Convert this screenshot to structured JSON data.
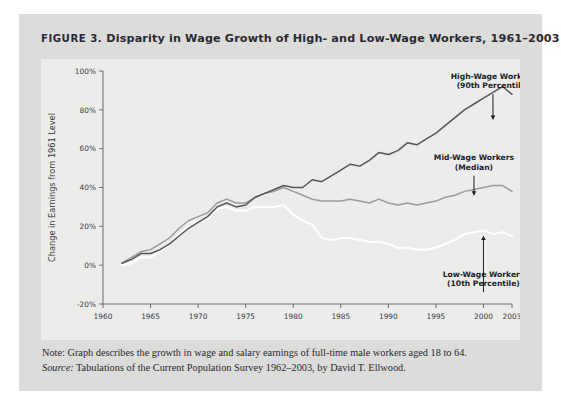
{
  "figure": {
    "label": "FIGURE 3.",
    "title": "Disparity in Wage Growth of High- and Low-Wage Workers, 1961–2003"
  },
  "notes": {
    "note_label": "Note:",
    "note_text": " Graph describes the growth in wage and salary earnings of full-time male workers aged 18 to 64.",
    "source_label": "Source:",
    "source_text": " Tabulations of the Current Population Survey 1962–2003, by David T. Ellwood."
  },
  "colors": {
    "card_background": "#dcdcda",
    "plot_background": "#ececeb",
    "axis": "#6b6b73",
    "high_wage_line": "#55555d",
    "mid_wage_line": "#9a9a9f",
    "low_wage_line": "#ffffff",
    "text": "#2a2a33"
  },
  "chart_data": {
    "type": "line",
    "title": "Disparity in Wage Growth of High- and Low-Wage Workers, 1961–2003",
    "xlabel": "",
    "ylabel": "Change in Earnings from 1961 Level",
    "xlim": [
      1960,
      2003
    ],
    "ylim": [
      -20,
      100
    ],
    "yticks": [
      -20,
      0,
      20,
      40,
      60,
      80,
      100
    ],
    "ytick_labels": [
      "-20%",
      "0%",
      "20%",
      "40%",
      "60%",
      "80%",
      "100%"
    ],
    "xticks": [
      1960,
      1965,
      1970,
      1975,
      1980,
      1985,
      1990,
      1995,
      2000,
      2003
    ],
    "xtick_labels": [
      "1960",
      "1965",
      "1970",
      "1975",
      "1980",
      "1985",
      "1990",
      "1995",
      "2000",
      "2003"
    ],
    "grid": false,
    "legend": "annotations",
    "x": [
      1962,
      1963,
      1964,
      1965,
      1966,
      1967,
      1968,
      1969,
      1970,
      1971,
      1972,
      1973,
      1974,
      1975,
      1976,
      1977,
      1978,
      1979,
      1980,
      1981,
      1982,
      1983,
      1984,
      1985,
      1986,
      1987,
      1988,
      1989,
      1990,
      1991,
      1992,
      1993,
      1994,
      1995,
      1996,
      1997,
      1998,
      1999,
      2000,
      2001,
      2002,
      2003
    ],
    "series": [
      {
        "name": "High-Wage Workers (90th Percentile)",
        "annotation": "High-Wage Workers\n(90th Percentile)",
        "color": "#55555d",
        "values": [
          1,
          3,
          6,
          6,
          8,
          11,
          15,
          19,
          22,
          25,
          30,
          32,
          30,
          31,
          35,
          37,
          39,
          41,
          40,
          40,
          44,
          43,
          46,
          49,
          52,
          51,
          54,
          58,
          57,
          59,
          63,
          62,
          65,
          68,
          72,
          76,
          80,
          83,
          86,
          89,
          92,
          88
        ]
      },
      {
        "name": "Mid-Wage Workers (Median)",
        "annotation": "Mid-Wage Workers\n(Median)",
        "color": "#9a9a9f",
        "values": [
          1,
          4,
          7,
          8,
          11,
          14,
          19,
          23,
          25,
          27,
          32,
          34,
          32,
          32,
          35,
          37,
          38,
          40,
          38,
          36,
          34,
          33,
          33,
          33,
          34,
          33,
          32,
          34,
          32,
          31,
          32,
          31,
          32,
          33,
          35,
          36,
          38,
          39,
          40,
          41,
          41,
          38
        ]
      },
      {
        "name": "Low-Wage Workers (10th Percentile)",
        "annotation": "Low-Wage Workers\n(10th Percentile)",
        "color": "#ffffff",
        "values": [
          0,
          1,
          4,
          4,
          7,
          11,
          16,
          20,
          23,
          24,
          29,
          30,
          28,
          28,
          30,
          30,
          30,
          31,
          26,
          23,
          21,
          14,
          13,
          14,
          14,
          13,
          12,
          12,
          11,
          9,
          9,
          8,
          8,
          9,
          11,
          13,
          16,
          17,
          18,
          16,
          17,
          15
        ]
      }
    ],
    "annotation_positions": [
      {
        "series": "High-Wage Workers (90th Percentile)",
        "label_x": 2001,
        "label_y": 96,
        "point_x": 2001,
        "point_y": 74
      },
      {
        "series": "Mid-Wage Workers (Median)",
        "label_x": 1999,
        "label_y": 54,
        "point_x": 1999,
        "point_y": 35
      },
      {
        "series": "Low-Wage Workers (10th Percentile)",
        "label_x": 2000,
        "label_y": -6,
        "point_x": 2000,
        "point_y": 16
      }
    ]
  }
}
